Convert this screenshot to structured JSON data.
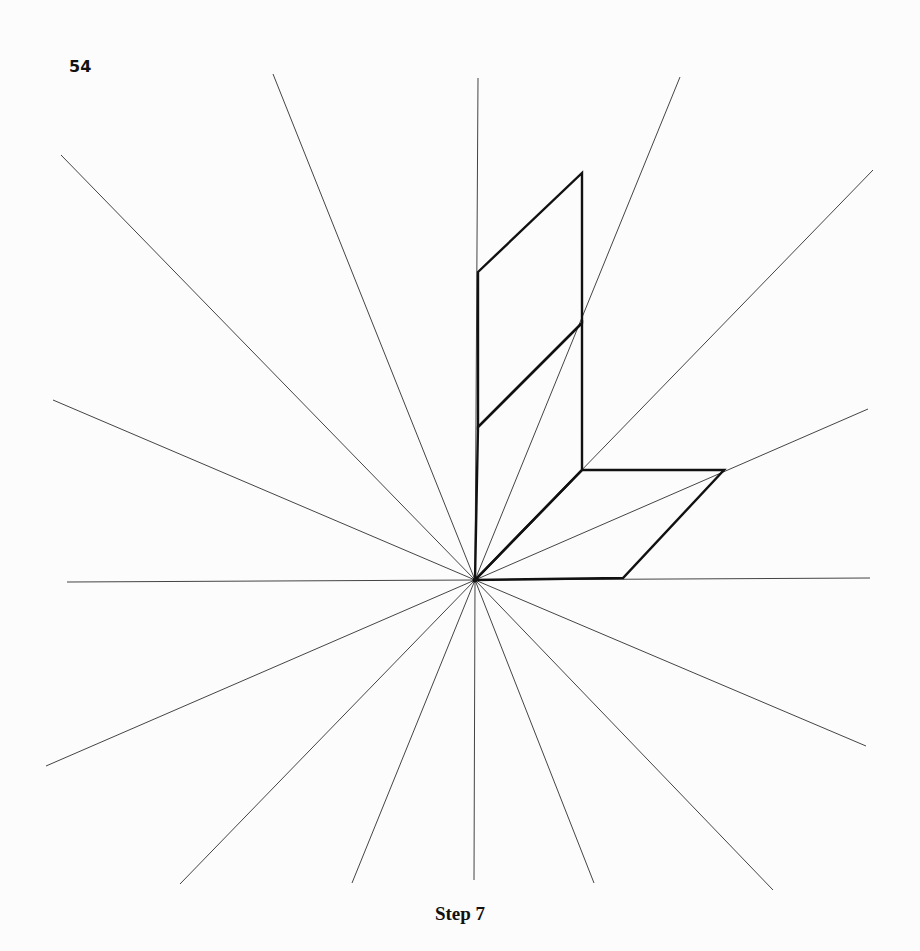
{
  "page": {
    "page_number": "54",
    "caption": "Step 7"
  },
  "diagram": {
    "center": [
      475,
      580
    ],
    "rays": [
      {
        "x": 870,
        "y": 578
      },
      {
        "x": 868,
        "y": 409
      },
      {
        "x": 873,
        "y": 170
      },
      {
        "x": 680,
        "y": 77
      },
      {
        "x": 478,
        "y": 78
      },
      {
        "x": 273,
        "y": 74
      },
      {
        "x": 61,
        "y": 155
      },
      {
        "x": 53,
        "y": 400
      },
      {
        "x": 67,
        "y": 582
      },
      {
        "x": 46,
        "y": 766
      },
      {
        "x": 180,
        "y": 884
      },
      {
        "x": 352,
        "y": 883
      },
      {
        "x": 474,
        "y": 880
      },
      {
        "x": 594,
        "y": 883
      },
      {
        "x": 773,
        "y": 890
      },
      {
        "x": 866,
        "y": 746
      }
    ],
    "shapes": [
      {
        "name": "upper-parallelogram",
        "points": [
          [
            478,
            272
          ],
          [
            582,
            173
          ],
          [
            582,
            323
          ],
          [
            478,
            427
          ]
        ]
      },
      {
        "name": "lower-parallelogram",
        "points": [
          [
            478,
            427
          ],
          [
            582,
            323
          ],
          [
            582,
            470
          ],
          [
            475,
            580
          ]
        ]
      },
      {
        "name": "right-parallelogram",
        "points": [
          [
            475,
            580
          ],
          [
            582,
            470
          ],
          [
            724,
            470
          ],
          [
            623,
            578
          ]
        ]
      }
    ],
    "colors": {
      "ray": "#444444",
      "shape": "#111111",
      "background": "#fcfcfc"
    }
  }
}
